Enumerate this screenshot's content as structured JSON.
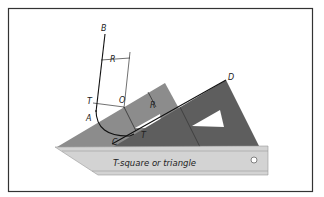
{
  "figure": {
    "type": "technical drawing",
    "caption_label": "T-square or triangle",
    "point_labels": {
      "B": "B",
      "D": "D",
      "O": "O",
      "T1": "T",
      "T2": "T",
      "A": "A",
      "C": "C",
      "R1": "R",
      "R2": "R"
    },
    "colors": {
      "frame": "#333333",
      "light_triangle": "#8a8a8a",
      "dark_triangle": "#5f5f5f",
      "tsquare": "#d2d2d2",
      "line": "#111111"
    }
  }
}
